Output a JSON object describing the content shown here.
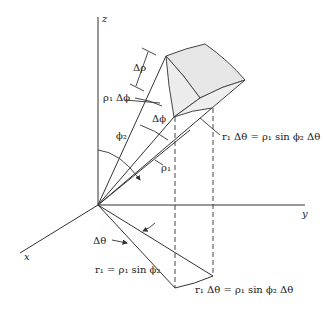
{
  "figure": {
    "type": "spherical-coordinates-volume-element",
    "axes": {
      "z": "z",
      "y": "y",
      "x": "x"
    },
    "labels": {
      "delta_rho": "Δρ",
      "rho1_delta_phi": "ρ₁ Δϕ",
      "delta_phi": "Δϕ",
      "phi2": "ϕ₂",
      "rho1": "ρ₁",
      "arc_top": "r₁ Δθ = ρ₁ sin ϕ₂ Δθ",
      "delta_theta": "Δθ",
      "r1_eq": "r₁ = ρ₁ sin ϕ₂",
      "arc_bottom": "r₁ Δθ = ρ₁ sin ϕ₂ Δθ"
    },
    "colors": {
      "line": "#333333",
      "fill": "#e6e6e6",
      "background": "#ffffff"
    }
  }
}
